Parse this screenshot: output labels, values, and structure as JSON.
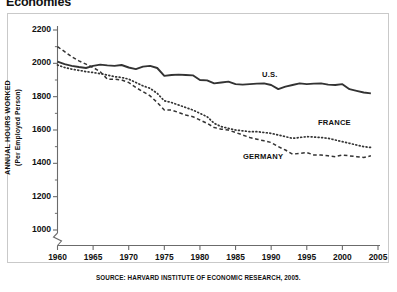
{
  "figure": {
    "title": "Economies",
    "source_note": "SOURCE: HARVARD INSTITUTE OF ECONOMIC RESEARCH, 2005."
  },
  "axis": {
    "y_title_main": "ANNUAL HOURS WORKED",
    "y_title_sub": "(Per Employed Person)",
    "y_ticks": [
      "2200",
      "2000",
      "1800",
      "1600",
      "1400",
      "1200",
      "1000"
    ],
    "x_ticks": [
      "1960",
      "1965",
      "1970",
      "1975",
      "1980",
      "1985",
      "1990",
      "1995",
      "2000",
      "2005"
    ]
  },
  "series_labels": {
    "us": "U.S.",
    "france": "FRANCE",
    "germany": "GERMANY"
  },
  "colors": {
    "line": "#333333",
    "axis": "#6b6b6b",
    "frame": "#c9c9c9",
    "text": "#111111"
  },
  "chart_data": {
    "type": "line",
    "title": "Economies",
    "xlabel": "",
    "ylabel": "ANNUAL HOURS WORKED (Per Employed Person)",
    "xlim": [
      1960,
      2005
    ],
    "ylim": [
      1000,
      2200
    ],
    "y_axis_break_below": 1000,
    "grid": false,
    "legend": "inline-labels",
    "x": [
      1960,
      1961,
      1962,
      1963,
      1964,
      1965,
      1966,
      1967,
      1968,
      1969,
      1970,
      1971,
      1972,
      1973,
      1974,
      1975,
      1976,
      1977,
      1978,
      1979,
      1980,
      1981,
      1982,
      1983,
      1984,
      1985,
      1986,
      1987,
      1988,
      1989,
      1990,
      1991,
      1992,
      1993,
      1994,
      1995,
      1996,
      1997,
      1998,
      1999,
      2000,
      2001,
      2002,
      2003,
      2004
    ],
    "series": [
      {
        "name": "U.S.",
        "style": "solid",
        "values": [
          2010,
          1995,
          1985,
          1978,
          1972,
          1985,
          1992,
          1988,
          1985,
          1990,
          1975,
          1965,
          1980,
          1985,
          1972,
          1925,
          1930,
          1932,
          1930,
          1928,
          1900,
          1898,
          1880,
          1885,
          1890,
          1875,
          1872,
          1875,
          1878,
          1880,
          1870,
          1845,
          1860,
          1870,
          1880,
          1875,
          1878,
          1880,
          1872,
          1870,
          1875,
          1845,
          1835,
          1825,
          1820
        ]
      },
      {
        "name": "FRANCE",
        "style": "dotted",
        "values": [
          1990,
          1975,
          1965,
          1958,
          1950,
          1945,
          1938,
          1930,
          1920,
          1915,
          1905,
          1885,
          1865,
          1850,
          1820,
          1775,
          1765,
          1750,
          1735,
          1720,
          1700,
          1680,
          1640,
          1620,
          1610,
          1600,
          1595,
          1590,
          1590,
          1585,
          1580,
          1570,
          1560,
          1550,
          1555,
          1560,
          1558,
          1555,
          1550,
          1540,
          1530,
          1520,
          1510,
          1500,
          1495
        ]
      },
      {
        "name": "GERMANY",
        "style": "dashed",
        "values": [
          2100,
          2070,
          2040,
          2015,
          1995,
          1975,
          1950,
          1905,
          1905,
          1900,
          1885,
          1855,
          1830,
          1805,
          1765,
          1720,
          1720,
          1705,
          1690,
          1680,
          1660,
          1640,
          1615,
          1605,
          1600,
          1585,
          1570,
          1555,
          1545,
          1535,
          1525,
          1500,
          1480,
          1455,
          1460,
          1465,
          1450,
          1450,
          1445,
          1440,
          1450,
          1445,
          1440,
          1435,
          1445
        ]
      }
    ]
  }
}
